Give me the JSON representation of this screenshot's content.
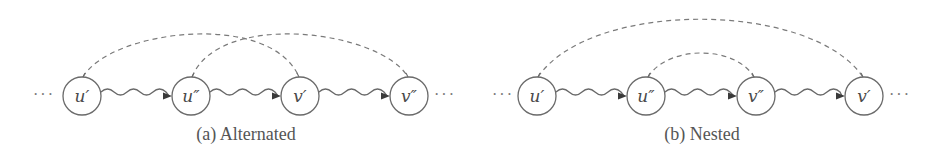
{
  "figure": {
    "panels": [
      {
        "id": "a",
        "caption": "(a) Alternated",
        "caption_x": 246,
        "leading_ellipsis": "···",
        "trailing_ellipsis": "···",
        "nodes": [
          {
            "label": "u′",
            "cx": 82,
            "cy": 96
          },
          {
            "label": "u″",
            "cx": 191,
            "cy": 96
          },
          {
            "label": "v′",
            "cx": 300,
            "cy": 96
          },
          {
            "label": "v″",
            "cx": 409,
            "cy": 96
          }
        ],
        "dashed_arcs": [
          {
            "from": "u′",
            "to": "v′"
          },
          {
            "from": "u″",
            "to": "v″"
          }
        ],
        "path_edges": [
          {
            "from": "u′",
            "to": "u″"
          },
          {
            "from": "u″",
            "to": "v′"
          },
          {
            "from": "v′",
            "to": "v″"
          }
        ]
      },
      {
        "id": "b",
        "caption": "(b) Nested",
        "caption_x": 702,
        "leading_ellipsis": "···",
        "trailing_ellipsis": "···",
        "nodes": [
          {
            "label": "u′",
            "cx": 537,
            "cy": 96
          },
          {
            "label": "u″",
            "cx": 646,
            "cy": 96
          },
          {
            "label": "v″",
            "cx": 756,
            "cy": 96
          },
          {
            "label": "v′",
            "cx": 864,
            "cy": 96
          }
        ],
        "dashed_arcs": [
          {
            "from": "u′",
            "to": "v′"
          },
          {
            "from": "u″",
            "to": "v″"
          }
        ],
        "path_edges": [
          {
            "from": "u′",
            "to": "u″"
          },
          {
            "from": "u″",
            "to": "v″"
          },
          {
            "from": "v″",
            "to": "v′"
          }
        ]
      }
    ],
    "colors": {
      "node_stroke": "#6a6a6a",
      "dashed_arc": "#7a7a7a",
      "text": "#4a4a4a"
    }
  }
}
